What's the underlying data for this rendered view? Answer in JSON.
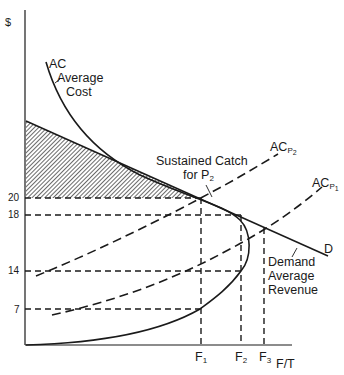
{
  "diagram": {
    "y_axis_label": "$",
    "x_axis_label": "F/T",
    "y_ticks": [
      "20",
      "18",
      "14",
      "7"
    ],
    "x_ticks": [
      {
        "base": "F",
        "sub": "1"
      },
      {
        "base": "F",
        "sub": "2"
      },
      {
        "base": "F",
        "sub": "3"
      }
    ],
    "curves": {
      "ac": {
        "short": "AC",
        "line1": "Average",
        "line2": "Cost"
      },
      "ac_p2": {
        "base": "AC",
        "sub": "P",
        "subsub": "2"
      },
      "ac_p1": {
        "base": "AC",
        "sub": "P",
        "subsub": "1"
      },
      "demand": {
        "short": "D",
        "line1": "Demand",
        "line2": "Average",
        "line3": "Revenue"
      }
    },
    "annotation": {
      "line1": "Sustained  Catch",
      "line2": "for P",
      "line2_sub": "2"
    },
    "colors": {
      "ink": "#1a1a1a",
      "background": "#ffffff"
    }
  }
}
